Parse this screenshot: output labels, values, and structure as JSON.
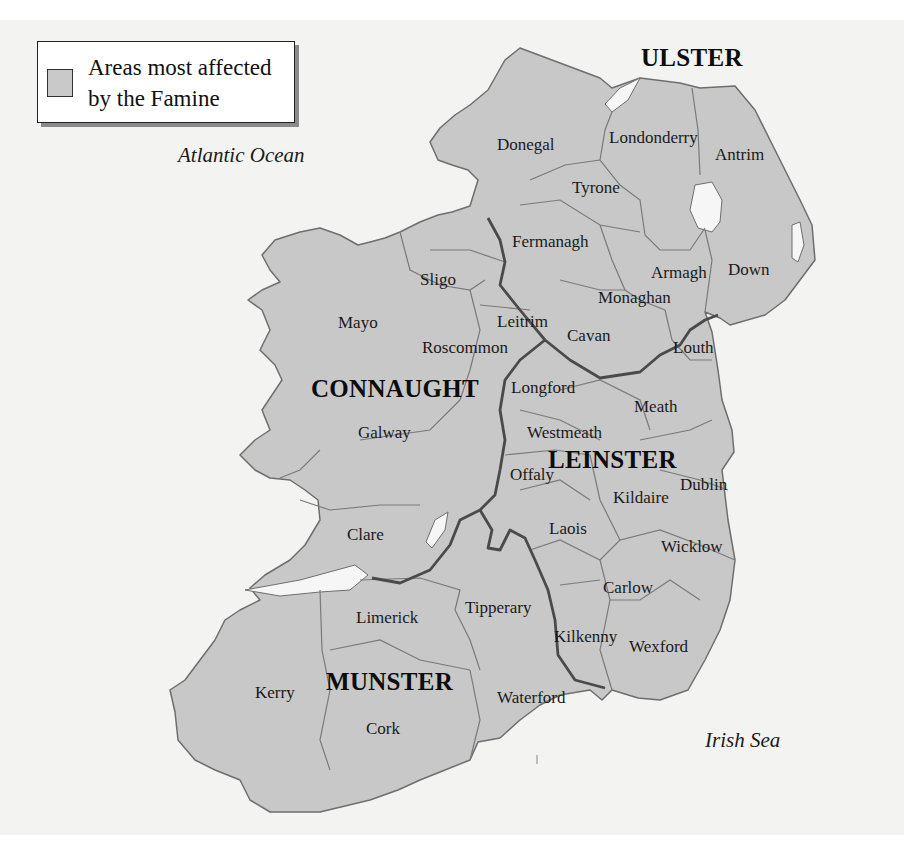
{
  "legend": {
    "text": "Areas most affected\nby the Famine",
    "swatch_color": "#c9c9c9"
  },
  "colors": {
    "land": "#c8c8c8",
    "water_background": "#f3f3f2",
    "lakes": "#f6f6f6",
    "county_border": "#7a7a7a",
    "province_border": "#4a4a4a",
    "coast": "#6e6e6e"
  },
  "water_bodies": {
    "atlantic": "Atlantic Ocean",
    "irish_sea": "Irish Sea"
  },
  "provinces": {
    "ulster": "ULSTER",
    "connaught": "CONNAUGHT",
    "leinster": "LEINSTER",
    "munster": "MUNSTER"
  },
  "counties": {
    "donegal": "Donegal",
    "londonderry": "Londonderry",
    "antrim": "Antrim",
    "tyrone": "Tyrone",
    "fermanagh": "Fermanagh",
    "armagh": "Armagh",
    "down": "Down",
    "monaghan": "Monaghan",
    "cavan": "Cavan",
    "sligo": "Sligo",
    "mayo": "Mayo",
    "leitrim": "Leitrim",
    "roscommon": "Roscommon",
    "louth": "Louth",
    "longford": "Longford",
    "meath": "Meath",
    "galway": "Galway",
    "westmeath": "Westmeath",
    "offaly": "Offaly",
    "dublin": "Dublin",
    "kildaire": "Kildaire",
    "laois": "Laois",
    "wicklow": "Wicklow",
    "clare": "Clare",
    "carlow": "Carlow",
    "limerick": "Limerick",
    "tipperary": "Tipperary",
    "kilkenny": "Kilkenny",
    "wexford": "Wexford",
    "kerry": "Kerry",
    "waterford": "Waterford",
    "cork": "Cork"
  }
}
